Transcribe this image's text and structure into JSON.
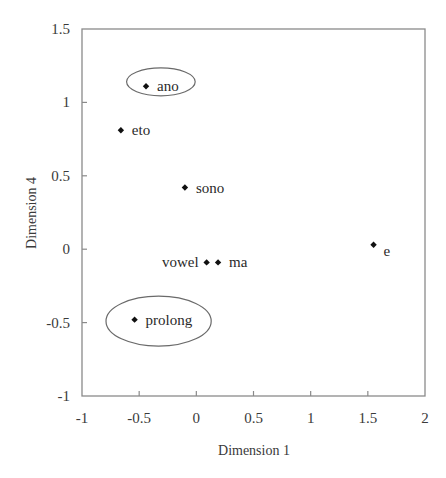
{
  "chart_data": {
    "type": "scatter",
    "title": "",
    "xlabel": "Dimension 1",
    "ylabel": "Dimension 4",
    "xlim": [
      -1,
      2
    ],
    "ylim": [
      -1,
      1.5
    ],
    "xticks": [
      -1,
      -0.5,
      0,
      0.5,
      1,
      1.5,
      2
    ],
    "yticks": [
      -1,
      -0.5,
      0,
      0.5,
      1,
      1.5
    ],
    "xtick_labels": [
      "-1",
      "-0.5",
      "0",
      "0.5",
      "1",
      "1.5",
      "2"
    ],
    "ytick_labels": [
      "-1",
      "-0.5",
      "0",
      "0.5",
      "1",
      "1.5"
    ],
    "grid": false,
    "legend": null,
    "points": [
      {
        "label": "ano",
        "x": -0.44,
        "y": 1.11,
        "label_side": "right",
        "circled": true
      },
      {
        "label": "eto",
        "x": -0.66,
        "y": 0.81,
        "label_side": "right",
        "circled": false
      },
      {
        "label": "sono",
        "x": -0.1,
        "y": 0.42,
        "label_side": "right",
        "circled": false
      },
      {
        "label": "vowel",
        "x": 0.09,
        "y": -0.09,
        "label_side": "left",
        "circled": false
      },
      {
        "label": "ma",
        "x": 0.19,
        "y": -0.09,
        "label_side": "right",
        "circled": false
      },
      {
        "label": "e",
        "x": 1.55,
        "y": 0.03,
        "label_side": "right-below",
        "circled": false
      },
      {
        "label": "prolong",
        "x": -0.54,
        "y": -0.48,
        "label_side": "right",
        "circled": true
      }
    ],
    "annotations": [
      {
        "type": "ellipse",
        "around": "ano",
        "cx": -0.31,
        "cy": 1.14,
        "rx_units": 0.3,
        "ry_units": 0.095
      },
      {
        "type": "ellipse",
        "around": "prolong",
        "cx": -0.33,
        "cy": -0.49,
        "rx_units": 0.46,
        "ry_units": 0.17
      }
    ]
  },
  "colors": {
    "frame": "#8a8a8a",
    "points": "#111111",
    "text": "#3a3a3a"
  }
}
